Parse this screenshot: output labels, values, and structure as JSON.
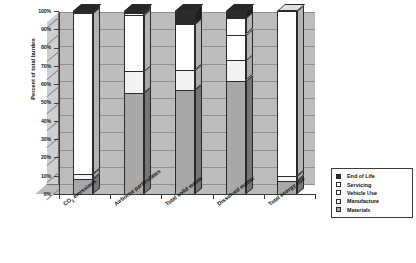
{
  "chart_data": {
    "type": "bar",
    "subtype": "stacked-column-3d",
    "title": "",
    "xlabel": "",
    "ylabel": "Percent of total burden",
    "ylim": [
      0,
      100
    ],
    "yunit": "%",
    "grid": true,
    "legend_position": "right-bottom",
    "stacked": true,
    "stack_total": 100,
    "categories": [
      "CO₂ emissions",
      "Airborne particulates",
      "Total solid waste",
      "Dissolved matter",
      "Total energy use"
    ],
    "ytick_labels": [
      "0%",
      "10%",
      "20%",
      "30%",
      "40%",
      "50%",
      "60%",
      "70%",
      "80%",
      "90%",
      "100%"
    ],
    "ytick_values": [
      0,
      10,
      20,
      30,
      40,
      50,
      60,
      70,
      80,
      90,
      100
    ],
    "series": [
      {
        "name": "Materials",
        "color": "#a8a8a8",
        "values": [
          8,
          55,
          57,
          62,
          7
        ]
      },
      {
        "name": "Manufacture",
        "color": "#f2f2f2",
        "values": [
          3,
          12,
          11,
          11,
          3
        ]
      },
      {
        "name": "Vehicle Use",
        "color": "#ffffff",
        "values": [
          88,
          31,
          25,
          14,
          90
        ]
      },
      {
        "name": "Servicing",
        "color": "#ffffff",
        "values": [
          0,
          1,
          0,
          9,
          0
        ]
      },
      {
        "name": "End of Life",
        "color": "#2b2b2b",
        "values": [
          1,
          1,
          7,
          4,
          0
        ]
      }
    ],
    "legend_entries": [
      {
        "label": "End of Life",
        "color": "#2b2b2b"
      },
      {
        "label": "Servicing",
        "color": "#ffffff"
      },
      {
        "label": "Vehicle Use",
        "color": "#ffffff"
      },
      {
        "label": "Manufacture",
        "color": "#f2f2f2"
      },
      {
        "label": "Materials",
        "color": "#a8a8a8"
      }
    ],
    "colors": {
      "plot_back_wall": "#bdbdbd",
      "plot_side_wall": "#cfcfcf",
      "plot_floor": "#bcbcbc",
      "gridline": "#8e8e8e",
      "axis": "#3a3a3a",
      "bar_outline": "#2b2b2b",
      "background": "#ffffff",
      "text": "#111111"
    }
  }
}
